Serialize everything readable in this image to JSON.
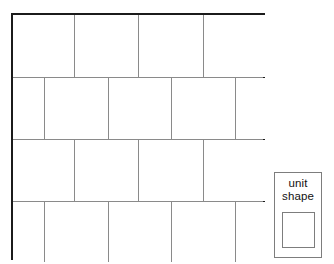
{
  "figure": {
    "name": "tiling-pattern",
    "border_color": "#1b1b1b",
    "grid_line_color": "#8a8a8a",
    "fill_color": "#ffffff",
    "bounds": {
      "x": 11,
      "y": 13,
      "width": 254,
      "height": 247
    },
    "rows": [
      {
        "index": 1,
        "offset": false,
        "tiles": [
          {
            "x": 0,
            "width": 61
          },
          {
            "x": 61,
            "width": 64
          },
          {
            "x": 125,
            "width": 65
          },
          {
            "x": 190,
            "width": 64
          }
        ]
      },
      {
        "index": 2,
        "offset": true,
        "tiles": [
          {
            "x": 0,
            "width": 31
          },
          {
            "x": 31,
            "width": 64
          },
          {
            "x": 95,
            "width": 63
          },
          {
            "x": 158,
            "width": 64
          },
          {
            "x": 222,
            "width": 32
          }
        ]
      },
      {
        "index": 3,
        "offset": false,
        "tiles": [
          {
            "x": 0,
            "width": 61
          },
          {
            "x": 61,
            "width": 64
          },
          {
            "x": 125,
            "width": 65
          },
          {
            "x": 190,
            "width": 64
          }
        ]
      },
      {
        "index": 4,
        "offset": true,
        "tiles": [
          {
            "x": 0,
            "width": 31
          },
          {
            "x": 31,
            "width": 64
          },
          {
            "x": 95,
            "width": 63
          },
          {
            "x": 158,
            "width": 64
          },
          {
            "x": 222,
            "width": 32
          }
        ]
      }
    ],
    "row_boundaries": [
      0,
      62,
      124,
      186,
      247
    ]
  },
  "legend": {
    "label": "unit\nshape",
    "label_line_1": "unit",
    "label_line_2": "shape",
    "border_color": "#7d7d7d",
    "bounds": {
      "x": 274,
      "y": 172,
      "width": 48,
      "height": 86
    },
    "swatch": {
      "name": "unit-square",
      "fill_color": "#ffffff",
      "border_color": "#7d7d7d",
      "bounds": {
        "x": 282,
        "y": 212,
        "width": 33,
        "height": 36
      }
    }
  }
}
